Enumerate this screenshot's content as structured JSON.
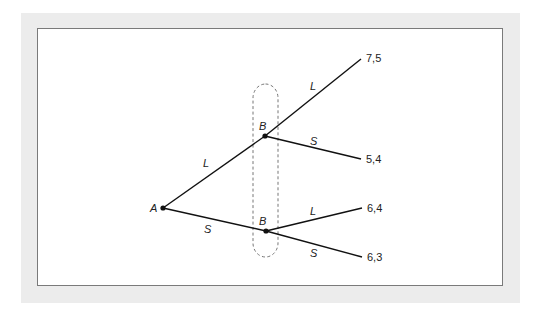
{
  "diagram": {
    "type": "extensive-form-game-tree",
    "nodes": [
      {
        "id": "A",
        "label": "A",
        "x": 163,
        "y": 208
      },
      {
        "id": "B1",
        "label": "B",
        "x": 265,
        "y": 136
      },
      {
        "id": "B2",
        "label": "B",
        "x": 266,
        "y": 231
      }
    ],
    "edges": [
      {
        "from": "A",
        "to": "B1",
        "label": "L"
      },
      {
        "from": "A",
        "to": "B2",
        "label": "S"
      },
      {
        "from": "B1",
        "to": "T1",
        "label": "L"
      },
      {
        "from": "B1",
        "to": "T2",
        "label": "S"
      },
      {
        "from": "B2",
        "to": "T3",
        "label": "L"
      },
      {
        "from": "B2",
        "to": "T4",
        "label": "S"
      }
    ],
    "terminals": [
      {
        "id": "T1",
        "payoff": "7,5"
      },
      {
        "id": "T2",
        "payoff": "5,4"
      },
      {
        "id": "T3",
        "payoff": "6,4"
      },
      {
        "id": "T4",
        "payoff": "6,3"
      }
    ],
    "information_set": {
      "player": "B",
      "members": [
        "B1",
        "B2"
      ],
      "style": "dashed"
    }
  },
  "labels": {
    "node_a": "A",
    "node_b_upper": "B",
    "node_b_lower": "B",
    "edge_a_l": "L",
    "edge_a_s": "S",
    "edge_b1_l": "L",
    "edge_b1_s": "S",
    "edge_b2_l": "L",
    "edge_b2_s": "S",
    "payoff_1": "7,5",
    "payoff_2": "5,4",
    "payoff_3": "6,4",
    "payoff_4": "6,3"
  }
}
